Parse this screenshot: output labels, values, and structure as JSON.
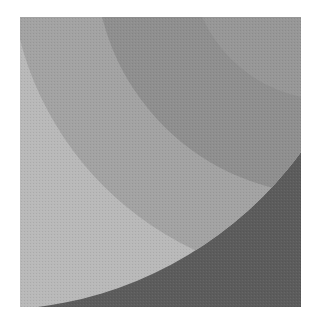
{
  "image": {
    "description": "Grayscale halftone print of overlapping concentric circular arcs within a square frame",
    "frame": {
      "x": 20,
      "y": 17,
      "width": 281,
      "height": 290
    },
    "colors": {
      "page_background": "#ffffff",
      "outer_light_band": "#b9b9b9",
      "middle_band": "#a3a3a3",
      "inner_band": "#8f8f8f",
      "core_band": "#979797",
      "dark_outside_region": "#5c5c5c"
    }
  }
}
